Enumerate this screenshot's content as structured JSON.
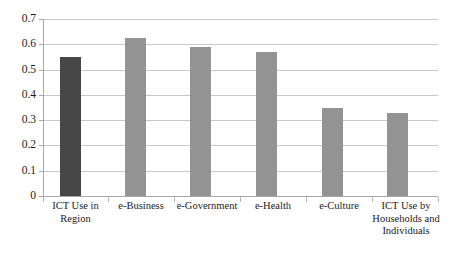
{
  "chart_data": {
    "type": "bar",
    "title": "",
    "subtitle": "",
    "xlabel": "",
    "ylabel": "",
    "ylim": [
      0,
      0.7
    ],
    "ytick_step": 0.1,
    "grid": true,
    "legend": "none",
    "categories": [
      "ICT Use in Region",
      "e-Business",
      "e-Government",
      "e-Health",
      "e-Culture",
      "ICT Use by Households and Individuals"
    ],
    "values": [
      0.55,
      0.625,
      0.59,
      0.57,
      0.35,
      0.33
    ],
    "ytick_labels": [
      "0",
      "0.1",
      "0.2",
      "0.3",
      "0.4",
      "0.5",
      "0.6",
      "0.7"
    ],
    "ytick_values": [
      0,
      0.1,
      0.2,
      0.3,
      0.4,
      0.5,
      0.6,
      0.7
    ],
    "bar_colors": [
      "#474747",
      "#939393",
      "#939393",
      "#939393",
      "#939393",
      "#939393"
    ],
    "colors": {
      "highlight_bar": "#474747",
      "normal_bar": "#939393",
      "gridline": "#c8c8c8",
      "axis": "#a8a8a8",
      "text": "#1b1b1b",
      "background": "#ffffff"
    }
  },
  "axis": {
    "y_labels": [
      "0.7",
      "0.6",
      "0.5",
      "0.4",
      "0.3",
      "0.2",
      "0.1",
      "0"
    ]
  },
  "categories": {
    "c0_line1": "ICT Use in",
    "c0_line2": "Region",
    "c1_line1": "e-Business",
    "c2_line1": "e-Government",
    "c3_line1": "e-Health",
    "c4_line1": "e-Culture",
    "c5_line1": "ICT Use by",
    "c5_line2": "Households and",
    "c5_line3": "Individuals"
  }
}
